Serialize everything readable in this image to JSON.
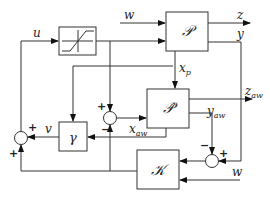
{
  "diagram": {
    "type": "block-diagram",
    "blocks": {
      "saturation": {
        "label": "",
        "icon": "saturation-icon"
      },
      "plant": {
        "label": "𝒫"
      },
      "plant_model": {
        "label": "𝒫̂"
      },
      "gamma": {
        "label": "γ"
      },
      "controller": {
        "label": "𝒦"
      }
    },
    "signals": {
      "u": "u",
      "w_top": "w",
      "z": "z",
      "y": "y",
      "x_p": "x",
      "x_p_sub": "p",
      "z_aw": "z",
      "z_aw_sub": "aw",
      "y_aw": "y",
      "y_aw_sub": "aw",
      "x_aw": "x",
      "x_aw_sub": "aw",
      "v": "v",
      "w_bottom": "w"
    },
    "signs": {
      "sum_left_top": "+",
      "sum_left_bottom": "+",
      "sum_mid_top": "+",
      "sum_mid_bottom": "−",
      "sum_right_top": "−",
      "sum_right_right": "+"
    }
  }
}
